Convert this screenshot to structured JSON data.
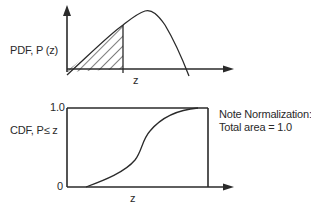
{
  "pdf_panel": {
    "ylabel": "PDF, P (z)",
    "xlabel": "z",
    "shaded_region": "area under curve left of z (hatched)"
  },
  "cdf_panel": {
    "ylabel": "CDF, P≤ z",
    "xlabel": "z",
    "y_tick_top": "1.0",
    "y_tick_bottom": "0"
  },
  "note": {
    "line1": "Note Normalization:",
    "line2": "Total area = 1.0"
  },
  "colors": {
    "ink": "#2a2a2a",
    "background": "#ffffff"
  }
}
